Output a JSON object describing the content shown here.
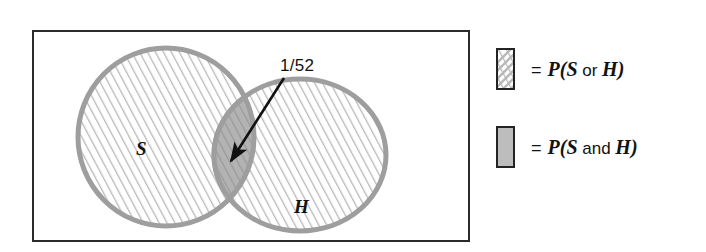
{
  "figure": {
    "type": "venn-diagram",
    "frame": {
      "border_color": "#2b2b2b"
    },
    "sets": [
      {
        "id": "S",
        "label": "S",
        "fill": "hatched",
        "outline_color": "#9e9e9e"
      },
      {
        "id": "H",
        "label": "H",
        "fill": "hatched",
        "outline_color": "#9e9e9e"
      }
    ],
    "intersection": {
      "fill": "solid-gray-hatched",
      "fill_color": "#b3b3b3",
      "callout_label": "1/52"
    },
    "arrow": {
      "from_label": "1/52",
      "points_to": "intersection",
      "color": "#111111"
    }
  },
  "legend": {
    "items": [
      {
        "id": "p-s-or-h",
        "swatch": "hatched-swatch-icon",
        "swatch_style": "hatched",
        "equals": "=",
        "prefix": "P(",
        "first": "S",
        "connector": " or ",
        "second": "H",
        "suffix": ")",
        "full_text": "= P(S or H)"
      },
      {
        "id": "p-s-and-h",
        "swatch": "solid-gray-swatch-icon",
        "swatch_style": "solid-gray",
        "swatch_color": "#bdbdbd",
        "equals": "=",
        "prefix": "P(",
        "first": "S",
        "connector": " and ",
        "second": "H",
        "suffix": ")",
        "full_text": "= P(S and H)"
      }
    ]
  },
  "colors": {
    "frame_stroke": "#2b2b2b",
    "circle_stroke": "#9e9e9e",
    "hatch_line": "#b9b9b9",
    "intersection_fill": "#b3b3b3",
    "swatch_solid": "#bdbdbd",
    "text": "#111111",
    "background": "#ffffff"
  }
}
